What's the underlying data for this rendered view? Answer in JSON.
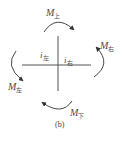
{
  "diagram": {
    "type": "joint-moment-diagram",
    "caption": "(b)",
    "moments": {
      "top": {
        "symbol": "M",
        "subscript": "上"
      },
      "right": {
        "symbol": "M",
        "subscript": "右"
      },
      "left": {
        "symbol": "M",
        "subscript": "左"
      },
      "bottom": {
        "symbol": "M",
        "subscript": "下"
      }
    },
    "stiffness": {
      "left": {
        "symbol": "i",
        "subscript": "左"
      },
      "right": {
        "symbol": "i",
        "subscript": "右"
      }
    },
    "colors": {
      "lines": "#555555",
      "arrows": "#333333",
      "text": "#4a4a4a"
    }
  }
}
